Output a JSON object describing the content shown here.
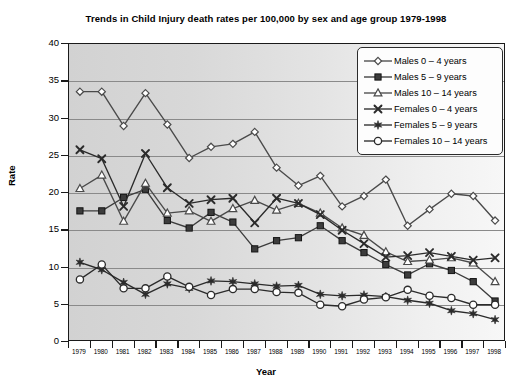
{
  "chart_data": {
    "type": "line",
    "title": "Trends in Child Injury death rates per 100,000 by sex and age group 1979-1998",
    "xlabel": "Year",
    "ylabel": "Rate",
    "ylim": [
      0,
      40
    ],
    "ytick_step": 5,
    "yticks": [
      40,
      35,
      30,
      25,
      20,
      15,
      10,
      5,
      0
    ],
    "grid": true,
    "legend_position": "top-right",
    "x": [
      1979,
      1980,
      1981,
      1982,
      1983,
      1984,
      1985,
      1986,
      1987,
      1988,
      1989,
      1990,
      1991,
      1992,
      1993,
      1994,
      1995,
      1996,
      1997,
      1998
    ],
    "categories": [
      "1979",
      "1980",
      "1981",
      "1982",
      "1983",
      "1984",
      "1985",
      "1986",
      "1987",
      "1988",
      "1989",
      "1990",
      "1991",
      "1992",
      "1993",
      "1994",
      "1995",
      "1996",
      "1997",
      "1998"
    ],
    "series": [
      {
        "name": "Males 0 – 4 years",
        "marker": "diamond-open",
        "color": "#4a4a4a",
        "values": [
          33.6,
          33.6,
          29.0,
          33.4,
          29.2,
          24.7,
          26.2,
          26.6,
          28.2,
          23.4,
          21.0,
          22.3,
          18.2,
          19.6,
          21.8,
          15.6,
          17.8,
          19.9,
          19.6,
          16.3
        ]
      },
      {
        "name": "Males 5 – 9 years",
        "marker": "square-filled",
        "color": "#3c3c3c",
        "values": [
          17.6,
          17.6,
          19.4,
          20.5,
          16.3,
          15.3,
          17.4,
          16.1,
          12.5,
          13.6,
          14.0,
          15.6,
          13.6,
          12.0,
          10.4,
          9.0,
          10.5,
          9.6,
          8.1,
          5.5
        ]
      },
      {
        "name": "Males 10 – 14 years",
        "marker": "triangle-open",
        "color": "#4a4a4a",
        "values": [
          20.6,
          22.4,
          16.2,
          21.3,
          17.3,
          17.6,
          16.2,
          17.9,
          19.0,
          17.7,
          18.6,
          17.3,
          15.3,
          14.3,
          12.1,
          10.8,
          11.0,
          11.3,
          10.6,
          8.1
        ]
      },
      {
        "name": "Females 0 – 4 years",
        "marker": "x-cross",
        "color": "#2b2b2b",
        "values": [
          25.8,
          24.6,
          18.2,
          25.3,
          20.7,
          18.6,
          19.1,
          19.3,
          16.0,
          19.3,
          18.6,
          17.1,
          15.0,
          13.2,
          11.4,
          11.6,
          12.0,
          11.5,
          11.0,
          11.3
        ]
      },
      {
        "name": "Females 5 – 9 years",
        "marker": "star-filled",
        "color": "#2b2b2b",
        "values": [
          10.7,
          9.7,
          8.0,
          6.4,
          7.8,
          7.2,
          8.2,
          8.1,
          7.8,
          7.5,
          7.6,
          6.4,
          6.2,
          6.3,
          6.1,
          5.6,
          5.2,
          4.2,
          3.8,
          3.0
        ]
      },
      {
        "name": "Females 10 – 14 years",
        "marker": "circle-open",
        "color": "#2b2b2b",
        "values": [
          8.4,
          10.4,
          7.2,
          7.2,
          8.8,
          7.4,
          6.3,
          7.1,
          7.1,
          6.7,
          6.6,
          5.0,
          4.8,
          5.7,
          6.0,
          7.0,
          6.2,
          5.9,
          5.0,
          5.0
        ]
      }
    ]
  }
}
